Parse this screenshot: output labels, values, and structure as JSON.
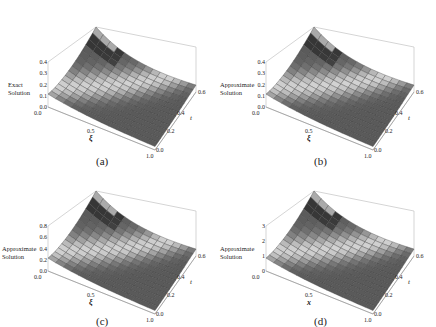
{
  "chart_data": [
    {
      "type": "surface3d",
      "panel": "a",
      "caption": "(a)",
      "zlabel": "Exact Solution",
      "xlabel": "ξ",
      "ylabel": "t",
      "z_ticks": [
        "0.4",
        "0.3",
        "0.2",
        "0.1",
        "0.0"
      ],
      "x_ticks": [
        "0.0",
        "0.5",
        "1.0"
      ],
      "y_ticks": [
        "0.0",
        "0.2",
        "0.4",
        "0.6"
      ],
      "zlim": [
        0,
        0.4
      ],
      "xlim": [
        0,
        1
      ],
      "ylim": [
        0,
        0.6
      ]
    },
    {
      "type": "surface3d",
      "panel": "b",
      "caption": "(b)",
      "zlabel": "Approximate Solution",
      "xlabel": "ξ",
      "ylabel": "t",
      "z_ticks": [
        "0.4",
        "0.3",
        "0.2",
        "0.1",
        "0.0"
      ],
      "x_ticks": [
        "0.0",
        "0.5",
        "1.0"
      ],
      "y_ticks": [
        "0.0",
        "0.2",
        "0.4",
        "0.6"
      ],
      "zlim": [
        0,
        0.4
      ],
      "xlim": [
        0,
        1
      ],
      "ylim": [
        0,
        0.6
      ]
    },
    {
      "type": "surface3d",
      "panel": "c",
      "caption": "(c)",
      "zlabel": "Approximate Solution",
      "xlabel": "ξ",
      "ylabel": "t",
      "z_ticks": [
        "0.8",
        "0.6",
        "0.4",
        "0.2",
        "0.0"
      ],
      "x_ticks": [
        "0.0",
        "0.5",
        "1.0"
      ],
      "y_ticks": [
        "0.0",
        "0.2",
        "0.4",
        "0.6"
      ],
      "zlim": [
        0,
        0.8
      ],
      "xlim": [
        0,
        1
      ],
      "ylim": [
        0,
        0.6
      ]
    },
    {
      "type": "surface3d",
      "panel": "d",
      "caption": "(d)",
      "zlabel": "Approximate Solution",
      "xlabel": "x",
      "ylabel": "t",
      "z_ticks": [
        "3",
        "2",
        "1",
        "0"
      ],
      "x_ticks": [
        "0.0",
        "0.5",
        "1.0"
      ],
      "y_ticks": [
        "0.0",
        "0.2",
        "0.4",
        "0.6"
      ],
      "zlim": [
        0,
        3
      ],
      "xlim": [
        0,
        1
      ],
      "ylim": [
        0,
        0.6
      ]
    }
  ]
}
